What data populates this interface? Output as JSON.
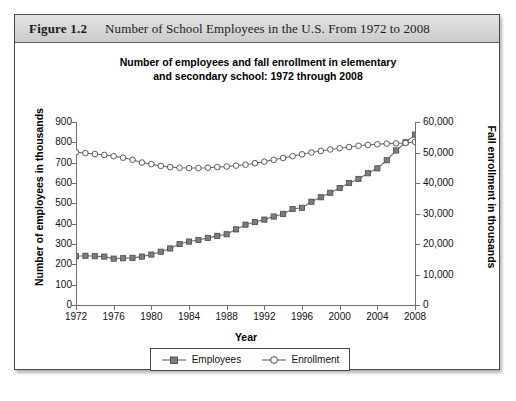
{
  "figure": {
    "label": "Figure 1.2",
    "caption": "Number of School Employees in the U.S. From 1972 to 2008"
  },
  "chart_data": {
    "type": "line",
    "title": "Number of employees and fall enrollment in elementary and secondary school: 1972 through 2008",
    "title_line1": "Number of employees and fall enrollment in elementary",
    "title_line2": "and secondary school: 1972 through 2008",
    "xlabel": "Year",
    "ylabel": "Number of employees in thousands",
    "ylabel_right": "Fall enrollment in thousands",
    "grid": false,
    "legend_position": "bottom",
    "xlim": [
      1972,
      2008
    ],
    "ylim": [
      0,
      900
    ],
    "ylim_right": [
      0,
      60000
    ],
    "xticks": [
      1972,
      1976,
      1980,
      1984,
      1988,
      1992,
      1996,
      2000,
      2004,
      2008
    ],
    "yticks": [
      0,
      100,
      200,
      300,
      400,
      500,
      600,
      700,
      800,
      900
    ],
    "yticks_right": [
      0,
      10000,
      20000,
      30000,
      40000,
      50000,
      60000
    ],
    "ytick_labels": [
      "0",
      "100",
      "200",
      "300",
      "400",
      "500",
      "600",
      "700",
      "800",
      "900"
    ],
    "ytick_labels_right": [
      "0",
      "10,000",
      "20,000",
      "30,000",
      "40,000",
      "50,000",
      "60,000"
    ],
    "x": [
      1972,
      1973,
      1974,
      1975,
      1976,
      1977,
      1978,
      1979,
      1980,
      1981,
      1982,
      1983,
      1984,
      1985,
      1986,
      1987,
      1988,
      1989,
      1990,
      1991,
      1992,
      1993,
      1994,
      1995,
      1996,
      1997,
      1998,
      1999,
      2000,
      2001,
      2002,
      2003,
      2004,
      2005,
      2006,
      2007,
      2008
    ],
    "series": [
      {
        "name": "Employees",
        "axis": "left",
        "marker": "filled-square",
        "color": "#7d7d7d",
        "values": [
          240,
          242,
          240,
          238,
          228,
          230,
          232,
          238,
          248,
          262,
          278,
          300,
          312,
          320,
          330,
          340,
          348,
          372,
          395,
          408,
          420,
          435,
          448,
          472,
          478,
          508,
          530,
          552,
          575,
          600,
          620,
          648,
          672,
          712,
          760,
          800,
          838
        ]
      },
      {
        "name": "Enrollment",
        "axis": "right",
        "marker": "open-circle",
        "color": "#6e6e6e",
        "values": [
          50100,
          49800,
          49500,
          49200,
          48800,
          48300,
          47600,
          46700,
          46200,
          45600,
          45200,
          45000,
          44900,
          44900,
          45000,
          45200,
          45400,
          45700,
          46000,
          46500,
          47000,
          47600,
          48200,
          48800,
          49400,
          50000,
          50500,
          51000,
          51400,
          51800,
          52200,
          52500,
          52700,
          52900,
          53000,
          53100,
          53500
        ]
      }
    ],
    "legend": [
      "Employees",
      "Enrollment"
    ]
  }
}
